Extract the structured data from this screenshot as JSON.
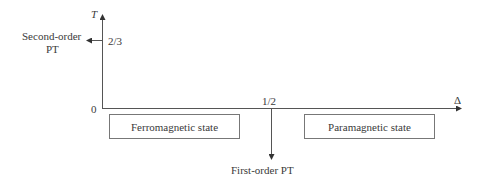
{
  "axes": {
    "y_label": "T",
    "x_label": "Δ",
    "origin_label": "0",
    "y_tick_label": "2/3",
    "x_tick_label": "1/2"
  },
  "annotations": {
    "second_order": "Second-order",
    "second_order_line2": "PT",
    "first_order": "First-order PT"
  },
  "states": {
    "ferromagnetic": "Ferromagnetic state",
    "paramagnetic": "Paramagnetic state"
  }
}
